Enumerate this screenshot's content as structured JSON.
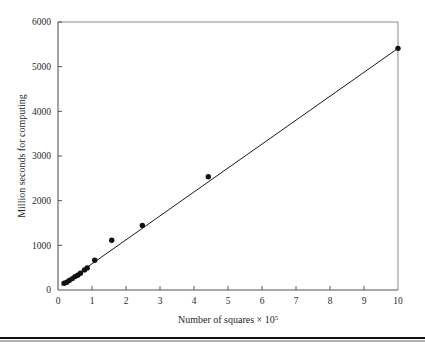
{
  "chart_data": {
    "type": "scatter",
    "title": "",
    "xlabel_prefix": "Number of squares × 10",
    "xlabel_exponent": "5",
    "xlabel": "Number of squares × 10⁵",
    "ylabel": "Million seconds for computing",
    "xlim": [
      0,
      10
    ],
    "ylim": [
      0,
      6000
    ],
    "xticks": [
      0,
      1,
      2,
      3,
      4,
      5,
      6,
      7,
      8,
      9,
      10
    ],
    "xtick_labels": [
      "0",
      "1",
      "2",
      "3",
      "4",
      "5",
      "6",
      "7",
      "8",
      "9",
      "10"
    ],
    "yticks": [
      0,
      1000,
      2000,
      3000,
      4000,
      5000,
      6000
    ],
    "ytick_labels": [
      "0",
      "1000",
      "2000",
      "3000",
      "4000",
      "5000",
      "6000"
    ],
    "grid": false,
    "legend": false,
    "marker_color": "#111111",
    "line_color": "#1a1a1a",
    "axis_color": "#555555",
    "background_color": "#ffffff",
    "series": [
      {
        "name": "Measured computing time",
        "type": "scatter",
        "points": [
          {
            "x": 0.18,
            "y": 150
          },
          {
            "x": 0.26,
            "y": 175
          },
          {
            "x": 0.33,
            "y": 215
          },
          {
            "x": 0.42,
            "y": 255
          },
          {
            "x": 0.5,
            "y": 300
          },
          {
            "x": 0.58,
            "y": 330
          },
          {
            "x": 0.66,
            "y": 375
          },
          {
            "x": 0.78,
            "y": 450
          },
          {
            "x": 0.86,
            "y": 495
          },
          {
            "x": 1.08,
            "y": 665
          },
          {
            "x": 1.58,
            "y": 1115
          },
          {
            "x": 2.48,
            "y": 1445
          },
          {
            "x": 4.42,
            "y": 2535
          },
          {
            "x": 10.0,
            "y": 5410
          }
        ]
      },
      {
        "name": "Fitted line",
        "type": "line",
        "points": [
          {
            "x": 0.1,
            "y": 105
          },
          {
            "x": 10.0,
            "y": 5410
          }
        ]
      }
    ]
  },
  "figure": {
    "bottom_rule": "horizontal-rule"
  }
}
